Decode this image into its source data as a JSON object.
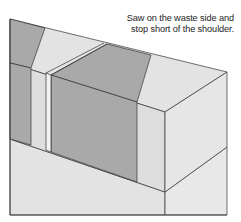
{
  "caption": {
    "line1": "Saw on the waste side and",
    "line2": "stop short of the shoulder."
  },
  "colors": {
    "dark_face": "#a9a9a9",
    "light_face": "#dedede",
    "lighter_face": "#e6e6e6",
    "line": "#333333"
  }
}
